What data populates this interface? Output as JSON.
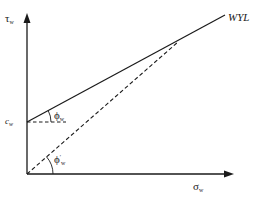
{
  "diagram": {
    "type": "failure-envelope",
    "axes": {
      "y": {
        "symbol": "τ",
        "subscript": "w"
      },
      "x": {
        "symbol": "σ",
        "subscript": "w"
      }
    },
    "labels": {
      "envelope": "WYL",
      "intercept": {
        "symbol": "c",
        "subscript": "w"
      },
      "angle_total": {
        "symbol": "ϕ",
        "subscript": "w"
      },
      "angle_effective": {
        "symbol": "ϕ",
        "subscript": "w",
        "prime": "′"
      }
    },
    "lines": {
      "envelope_solid": {
        "style": "solid",
        "from": [
          27,
          122
        ],
        "to": [
          225,
          15
        ]
      },
      "secant_dashed": {
        "style": "dashed",
        "from": [
          27,
          174
        ],
        "to": [
          178,
          42
        ]
      },
      "intercept_reference": {
        "style": "dashed",
        "from": [
          27,
          122
        ],
        "to": [
          65,
          122
        ]
      }
    },
    "colors": {
      "ink": "#1a1a1a",
      "background": "#ffffff"
    }
  }
}
